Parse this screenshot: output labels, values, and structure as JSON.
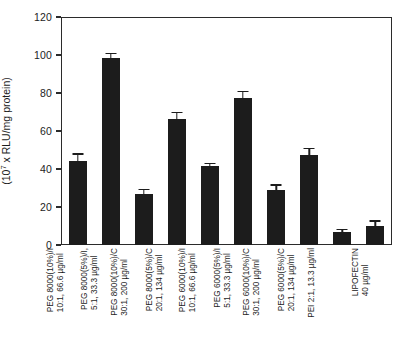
{
  "chart_data": {
    "type": "bar",
    "title": "",
    "xlabel": "",
    "ylabel": "Luciferase activity (10^7 x RLU/mg protein)",
    "ylabel_line1": "Luciferase activity",
    "ylabel_line2_pre": "(10",
    "ylabel_line2_sup": "7",
    "ylabel_line2_post": " x RLU/mg protein)",
    "ylim": [
      0,
      120
    ],
    "yticks": [
      0,
      20,
      40,
      60,
      80,
      100,
      120
    ],
    "ytick_labels": [
      "0",
      "20",
      "40",
      "60",
      "80",
      "100",
      "120"
    ],
    "grid": false,
    "legend": false,
    "bar_color": "#1c1c1c",
    "axis_color": "#2b2b2b",
    "categories": [
      "PEG 8000(10%)/I 10:1, 66.6 µg/ml",
      "PEG 8000(5%)/I 5:1, 33.3 µg/ml",
      "PEG 8000(10%)/C 30:1, 200 µg/ml",
      "PEG 8000(5%)/C 20:1, 134 µg/ml",
      "PEG 6000(10%)/I 10:1, 66.6 µg/ml",
      "PEG 6000(5%)/I 5:1, 33.3 µg/ml",
      "PEG 6000(10%)/C 30:1, 200 µg/ml",
      "PEG 6000(5%)/C 20:1, 134 µg/ml",
      "PEI 2:1, 13.3 µg/ml",
      "LIPOFECTIN 40 µg/ml"
    ],
    "category_lines": [
      [
        "PEG 8000(10%)/I",
        "10:1, 66.6 µg/ml"
      ],
      [
        "PEG 8000(5%)/I,",
        "5:1, 33.3 µg/ml"
      ],
      [
        "PEG 8000(10%)/C",
        "30:1, 200 µg/ml"
      ],
      [
        "PEG 8000(5%)/C",
        "20:1, 134 µg/ml"
      ],
      [
        "PEG 6000(10%)/I",
        "10:1, 66.6 µg/ml"
      ],
      [
        "PEG 6000(5%)/I",
        "5:1, 33.3 µg/ml"
      ],
      [
        "PEG 6000(10%)/C",
        "30:1, 200 µg/ml"
      ],
      [
        "PEG 6000(5%)/C",
        "20:1, 134 µg/ml"
      ],
      [
        "PEI 2:1, 13.3 µg/ml",
        ""
      ],
      [
        "LIPOFECTIN",
        "40 µg/ml"
      ]
    ],
    "values": [
      44,
      98.5,
      27,
      66.5,
      41.5,
      77.5,
      29,
      47.5,
      7,
      10
    ],
    "errors": [
      3.5,
      1.8,
      1.8,
      3.0,
      1.0,
      3.0,
      2.2,
      3.0,
      0.8,
      2.2
    ]
  }
}
